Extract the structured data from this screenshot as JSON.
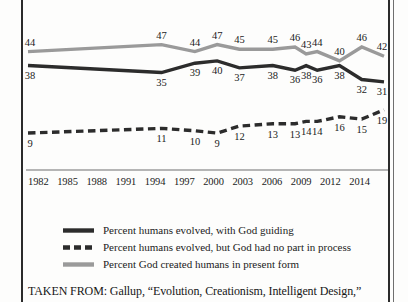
{
  "chart_data": {
    "type": "line",
    "title": "",
    "xlabel": "",
    "ylabel": "",
    "grid": false,
    "legend_position": "bottom",
    "ylim": [
      0,
      55
    ],
    "categories": [
      "1982",
      "1985",
      "1988",
      "1991",
      "1994",
      "1997",
      "2000",
      "2003",
      "2006",
      "2009",
      "2012",
      "2014"
    ],
    "x_tick_labels": [
      "1982",
      "1985",
      "1988",
      "1991",
      "1994",
      "1997",
      "2000",
      "2003",
      "2006",
      "2009",
      "2012",
      "2014"
    ],
    "series": [
      {
        "name": "Percent humans evolved, with God guiding",
        "style": "solid",
        "color": "#2c2c2c",
        "x": [
          1982,
          1994,
          1997,
          1999,
          2001,
          2004,
          2006,
          2007,
          2008,
          2010,
          2012,
          2014
        ],
        "values": [
          38,
          35,
          39,
          40,
          37,
          38,
          36,
          38,
          36,
          38,
          32,
          31
        ],
        "labels": [
          "38",
          "35",
          "39",
          "40",
          "37",
          "38",
          "36",
          "38",
          "36",
          "38",
          "32",
          "31"
        ]
      },
      {
        "name": "Percent humans evolved, but God had no part in process",
        "style": "dashed",
        "color": "#2c2c2c",
        "x": [
          1982,
          1994,
          1997,
          1999,
          2001,
          2004,
          2006,
          2007,
          2008,
          2010,
          2012,
          2014
        ],
        "values": [
          9,
          11,
          10,
          9,
          12,
          13,
          13,
          14,
          14,
          16,
          15,
          19
        ],
        "labels": [
          "9",
          "11",
          "10",
          "9",
          "12",
          "13",
          "13",
          "14",
          "14",
          "16",
          "15",
          "19"
        ]
      },
      {
        "name": "Percent God created humans in present form",
        "style": "solid",
        "color": "#9a9a9a",
        "x": [
          1982,
          1994,
          1997,
          1999,
          2001,
          2004,
          2006,
          2007,
          2008,
          2010,
          2012,
          2014
        ],
        "values": [
          44,
          47,
          44,
          47,
          45,
          45,
          46,
          43,
          44,
          40,
          46,
          42
        ],
        "labels": [
          "44",
          "47",
          "44",
          "47",
          "45",
          "45",
          "46",
          "43",
          "44",
          "40",
          "46",
          "42"
        ]
      }
    ]
  },
  "legend": {
    "items": [
      {
        "label": "Percent humans evolved, with God guiding",
        "swatch": "solid-dark-line-swatch"
      },
      {
        "label": "Percent humans evolved, but God had no part in process",
        "swatch": "dashed-dark-line-swatch"
      },
      {
        "label": "Percent God created humans in present form",
        "swatch": "solid-gray-line-swatch"
      }
    ]
  },
  "caption": {
    "text": "TAKEN FROM: Gallup, “Evolution, Creationism, Intelligent Design,”"
  },
  "colors": {
    "dark_line": "#2c2c2c",
    "gray_line": "#9a9a9a",
    "axis": "#6f6f6f",
    "frame": "#2b2b2b",
    "text": "#1b1b1b",
    "background": "#fdfdfc"
  }
}
